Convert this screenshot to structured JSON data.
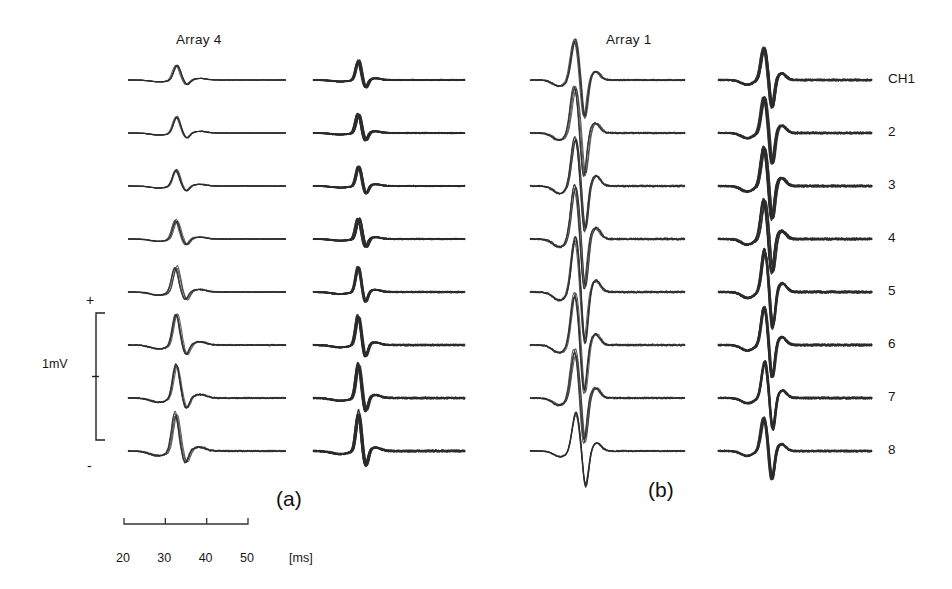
{
  "figure": {
    "panels": [
      {
        "id": "a",
        "letter": "(a)",
        "title": "Array 4",
        "letter_x": 276,
        "letter_y": 487,
        "title_x": 176,
        "title_y": 32
      },
      {
        "id": "b",
        "letter": "(b)",
        "title": "Array 1",
        "letter_x": 648,
        "letter_y": 478,
        "title_x": 606,
        "title_y": 32
      }
    ],
    "channel_label_prefix": "CH",
    "channel_labels": [
      "CH1",
      "2",
      "3",
      "4",
      "5",
      "6",
      "7",
      "8"
    ],
    "channel_label_x": 888,
    "scale_bar": {
      "label": "1mV",
      "plus": "+",
      "minus": "-",
      "label_x": 42,
      "label_y": 357,
      "plus_x": 86,
      "plus_y": 292,
      "minus_x": 87,
      "minus_y": 458,
      "bar_x": 96,
      "bar_top": 313,
      "bar_bottom": 440
    },
    "time_axis": {
      "unit": "[ms]",
      "unit_x": 289,
      "unit_y": 551,
      "ticks": [
        "20",
        "30",
        "40",
        "50"
      ],
      "tick_values": [
        20,
        30,
        40,
        50
      ],
      "axis_x_start": 124,
      "axis_x_end": 248,
      "axis_y": 524,
      "label_y": 551
    }
  },
  "chart_data": {
    "type": "line",
    "title": "",
    "subtitle": "",
    "xlabel": "[ms]",
    "ylabel": "1mV",
    "xlim": [
      20,
      50
    ],
    "xticks": [
      20,
      30,
      40,
      50
    ],
    "grid": false,
    "legend": null,
    "annotations": [
      "(a)",
      "(b)",
      "Array 4",
      "Array 1",
      "1mV",
      "+",
      "-",
      "[ms]"
    ],
    "columns": [
      {
        "name": "Array 4 - col 1",
        "panel": "a",
        "x": 128,
        "width": 158,
        "amp_scale": [
          0.45,
          0.5,
          0.48,
          0.58,
          0.78,
          0.95,
          1.05,
          1.18
        ],
        "ink": "light"
      },
      {
        "name": "Array 4 - col 2",
        "panel": "a",
        "x": 313,
        "width": 152,
        "amp_scale": [
          0.55,
          0.55,
          0.55,
          0.6,
          0.72,
          0.85,
          1.0,
          1.15
        ],
        "ink": "dark"
      },
      {
        "name": "Array 1 - col 3",
        "panel": "b",
        "x": 530,
        "width": 155,
        "amp_scale": [
          1.1,
          1.25,
          1.4,
          1.45,
          1.5,
          1.4,
          1.3,
          1.05
        ],
        "ink": "light"
      },
      {
        "name": "Array 1 - col 4",
        "panel": "b",
        "x": 718,
        "width": 154,
        "amp_scale": [
          1.0,
          1.05,
          1.15,
          1.2,
          1.25,
          1.2,
          1.1,
          1.0
        ],
        "ink": "dark"
      }
    ],
    "rows": [
      {
        "channel": "CH1",
        "baseline_y": 80
      },
      {
        "channel": "2",
        "baseline_y": 133
      },
      {
        "channel": "3",
        "baseline_y": 186
      },
      {
        "channel": "4",
        "baseline_y": 239
      },
      {
        "channel": "5",
        "baseline_y": 292
      },
      {
        "channel": "6",
        "baseline_y": 345
      },
      {
        "channel": "7",
        "baseline_y": 398
      },
      {
        "channel": "8",
        "baseline_y": 451
      }
    ],
    "waveform_shapes": {
      "array4": {
        "comment": "sharp positive peak near 26-27 ms, small negative notch ~30-32 ms, then flat tail",
        "peak_ms": 26.5,
        "trough_ms": 31.0,
        "peak_mv": 0.9,
        "trough_mv": -0.35
      },
      "array1": {
        "comment": "broad positive peak ~26 ms followed by deep sharp negative trough ~28-29 ms, recovery then flat",
        "peak_ms": 26.0,
        "trough_ms": 28.5,
        "peak_mv": 1.3,
        "trough_mv": -1.2
      }
    }
  }
}
